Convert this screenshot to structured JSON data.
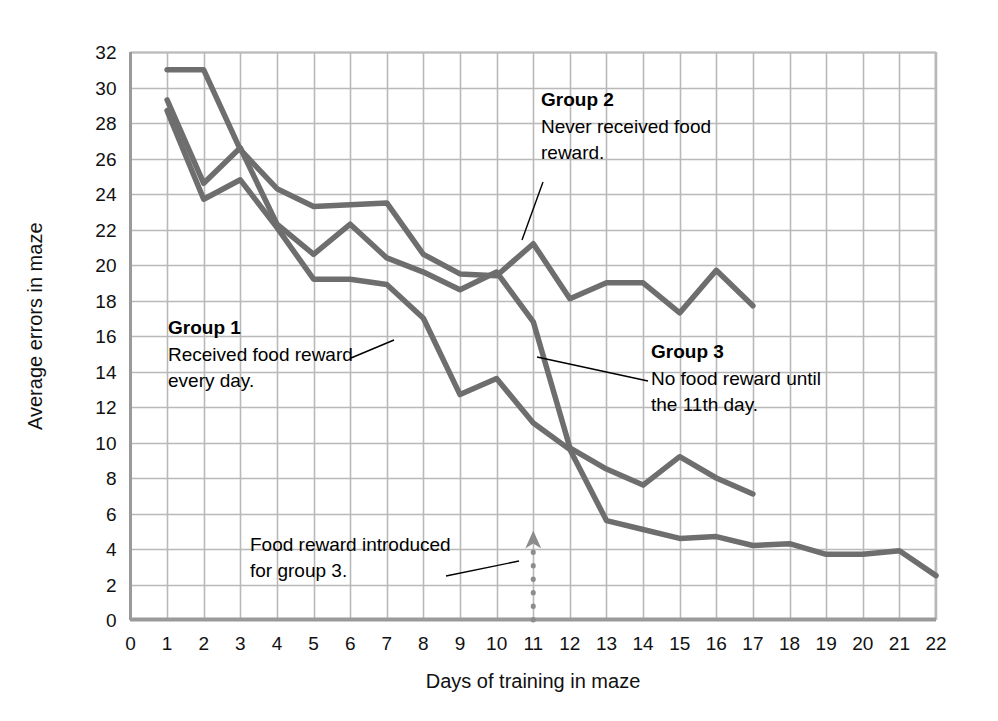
{
  "chart_data": {
    "type": "line",
    "title": "",
    "xlabel": "Days of training in maze",
    "ylabel": "Average errors in maze",
    "xlim": [
      0,
      22
    ],
    "ylim": [
      0,
      32
    ],
    "xticks": [
      "0",
      "1",
      "2",
      "3",
      "4",
      "5",
      "6",
      "7",
      "8",
      "9",
      "10",
      "11",
      "12",
      "13",
      "14",
      "15",
      "16",
      "17",
      "18",
      "19",
      "20",
      "21",
      "22"
    ],
    "yticks": [
      "0",
      "2",
      "4",
      "6",
      "8",
      "10",
      "12",
      "14",
      "16",
      "18",
      "20",
      "22",
      "24",
      "26",
      "28",
      "30",
      "32"
    ],
    "grid": true,
    "legend_position": "inline-annotations",
    "line_color": "#6e6e6e",
    "grid_color": "#b9b9b9",
    "axis_color": "#9a9a9a",
    "series": [
      {
        "name": "Group 1",
        "x": [
          1,
          2,
          3,
          4,
          5,
          6,
          7,
          8,
          9,
          10,
          11,
          12,
          13,
          14,
          15,
          16,
          17,
          18,
          19,
          20,
          21,
          22
        ],
        "values": [
          28.7,
          23.7,
          24.8,
          22.1,
          19.2,
          19.2,
          18.9,
          17.0,
          12.7,
          13.6,
          11.1,
          9.6,
          5.6,
          5.1,
          4.6,
          4.7,
          4.2,
          4.3,
          3.7,
          3.7,
          3.9,
          2.5
        ]
      },
      {
        "name": "Group 2",
        "x": [
          1,
          2,
          3,
          4,
          5,
          6,
          7,
          8,
          9,
          10,
          11,
          12,
          13,
          14,
          15,
          16,
          17
        ],
        "values": [
          31.0,
          31.0,
          26.5,
          24.3,
          23.3,
          23.4,
          23.5,
          20.6,
          19.5,
          19.4,
          21.2,
          18.1,
          19.0,
          19.0,
          17.3,
          19.7,
          17.7
        ]
      },
      {
        "name": "Group 3",
        "x": [
          1,
          2,
          3,
          4,
          5,
          6,
          7,
          8,
          9,
          10,
          11,
          12,
          13,
          14,
          15,
          16,
          17
        ],
        "values": [
          29.3,
          24.6,
          26.6,
          22.3,
          20.6,
          22.3,
          20.4,
          19.6,
          18.6,
          19.6,
          16.8,
          9.7,
          8.5,
          7.6,
          9.2,
          8.0,
          7.1
        ]
      }
    ],
    "annotations": [
      {
        "id": "group-1",
        "heading": "Group 1",
        "lines": [
          "Received food reward",
          "every day."
        ],
        "x": 168,
        "y": 334,
        "leader": {
          "x1": 351,
          "y1": 358,
          "x2": 394,
          "y2": 340
        }
      },
      {
        "id": "group-2",
        "heading": "Group 2",
        "lines": [
          "Never received food",
          "reward."
        ],
        "x": 541,
        "y": 106,
        "leader": {
          "x1": 543,
          "y1": 182,
          "x2": 522,
          "y2": 240
        }
      },
      {
        "id": "group-3",
        "heading": "Group 3",
        "lines": [
          "No food reward until",
          "the 11th day."
        ],
        "x": 651,
        "y": 358,
        "leader": {
          "x1": 648,
          "y1": 381,
          "x2": 537,
          "y2": 357
        }
      },
      {
        "id": "food-reward-marker",
        "heading": "",
        "lines": [
          "Food reward introduced",
          "for group 3."
        ],
        "x": 250,
        "y": 551,
        "leader": {
          "x1": 446,
          "y1": 576,
          "x2": 519,
          "y2": 561
        }
      }
    ],
    "marker": {
      "label": "food reward introduced for group 3",
      "x_value": 11,
      "y_from": 0,
      "y_to": 4.7,
      "style": "dotted-arrow-up",
      "color": "#8c8c8c"
    }
  }
}
